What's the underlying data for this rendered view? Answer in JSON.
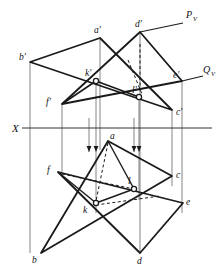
{
  "figure": {
    "background_color": "#ffffff",
    "line_color": "#1a1a1a",
    "thin_line_color": "#555555",
    "width": 223,
    "height": 274
  },
  "axis": {
    "name": "ground-line",
    "label": "X",
    "label_x": 12,
    "label_y": 132,
    "y": 128,
    "x_start": 22,
    "x_end": 212
  },
  "trace_labels": [
    {
      "id": "pv",
      "letter": "P",
      "subscript": "V",
      "x": 186,
      "y": 18
    },
    {
      "id": "qv",
      "letter": "Q",
      "subscript": "V",
      "x": 203,
      "y": 73
    }
  ],
  "vertical_projection": {
    "note": "front view (above X), vertices marked with prime",
    "points": [
      {
        "name": "a-prime",
        "label": "a'",
        "x": 100,
        "y": 38,
        "label_x": 94,
        "label_y": 33
      },
      {
        "name": "b-prime",
        "label": "b'",
        "x": 30,
        "y": 62,
        "label_x": 21,
        "label_y": 60
      },
      {
        "name": "c-prime",
        "label": "c'",
        "x": 172,
        "y": 110,
        "label_x": 176,
        "label_y": 114
      },
      {
        "name": "d-prime",
        "label": "d'",
        "x": 140,
        "y": 32,
        "label_x": 136,
        "label_y": 27
      },
      {
        "name": "e-prime",
        "label": "e'",
        "x": 182,
        "y": 81,
        "label_x": 175,
        "label_y": 78
      },
      {
        "name": "f-prime",
        "label": "f'",
        "x": 62,
        "y": 104,
        "label_x": 46,
        "label_y": 103
      },
      {
        "name": "k-prime",
        "label": "k'",
        "x": 96,
        "y": 81,
        "label_x": 87,
        "label_y": 75
      },
      {
        "name": "l-prime",
        "label": "l'",
        "x": 139,
        "y": 97,
        "label_x": 132,
        "label_y": 92
      }
    ]
  },
  "horizontal_projection": {
    "note": "top view (below X), vertices unprimed",
    "points": [
      {
        "name": "a",
        "label": "a",
        "x": 108,
        "y": 141,
        "label_x": 111,
        "label_y": 139
      },
      {
        "name": "b",
        "label": "b",
        "x": 41,
        "y": 253,
        "label_x": 33,
        "label_y": 261
      },
      {
        "name": "c",
        "label": "c",
        "x": 172,
        "y": 176,
        "label_x": 176,
        "label_y": 176
      },
      {
        "name": "d",
        "label": "d",
        "x": 140,
        "y": 253,
        "label_x": 138,
        "label_y": 262
      },
      {
        "name": "e",
        "label": "e",
        "x": 183,
        "y": 203,
        "label_x": 186,
        "label_y": 203
      },
      {
        "name": "f",
        "label": "f",
        "x": 58,
        "y": 172,
        "label_x": 49,
        "label_y": 172
      },
      {
        "name": "k",
        "label": "k",
        "x": 96,
        "y": 203,
        "label_x": 83,
        "label_y": 211
      },
      {
        "name": "l",
        "label": "l",
        "x": 134,
        "y": 189,
        "label_x": 128,
        "label_y": 183
      }
    ]
  },
  "triangles": {
    "front": [
      {
        "name": "triangle-abc-front",
        "vertices": "a'-b'-c'"
      },
      {
        "name": "triangle-def-front",
        "vertices": "d'-e'-f'"
      }
    ],
    "top": [
      {
        "name": "triangle-abc-top",
        "vertices": "a-b-c"
      },
      {
        "name": "triangle-def-top",
        "vertices": "d-e-f"
      }
    ]
  },
  "projection_arrows": {
    "name": "downward-projector-arrows",
    "direction": "down",
    "count": 4,
    "x_positions": [
      89,
      96,
      134,
      139
    ],
    "arrow_y": 148
  },
  "intersection_line": {
    "name": "intersection-kl",
    "front_segment": "k'-l'",
    "top_segment": "k-l"
  }
}
